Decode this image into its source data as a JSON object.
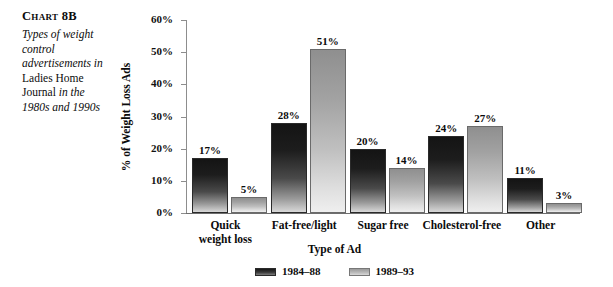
{
  "figure": {
    "label": "Chart 8B",
    "caption_lines": [
      {
        "text": "Types of weight",
        "style": "italic"
      },
      {
        "text": "control",
        "style": "italic"
      },
      {
        "text": "advertisements in",
        "style": "italic"
      },
      {
        "text": "Ladies Home",
        "style": "roman"
      },
      {
        "text": "Journal",
        "style": "roman",
        "trailing": " in the",
        "trailing_style": "italic"
      },
      {
        "text": "1980s and 1990s",
        "style": "italic"
      }
    ],
    "caption_plain": "Types of weight control advertisements in Ladies Home Journal in the 1980s and 1990s"
  },
  "chart_data": {
    "type": "bar",
    "title": "Chart 8B",
    "subtitle": "Types of weight control advertisements in Ladies Home Journal in the 1980s and 1990s",
    "xlabel": "Type of Ad",
    "ylabel": "% of Weight Loss Ads",
    "ylim": [
      0,
      60
    ],
    "yticks": [
      0,
      10,
      20,
      30,
      40,
      50,
      60
    ],
    "ytick_labels": [
      "0%",
      "10%",
      "20%",
      "30%",
      "40%",
      "50%",
      "60%"
    ],
    "grid": false,
    "legend_position": "bottom-center",
    "categories": [
      "Quick\nweight loss",
      "Fat-free/light",
      "Sugar free",
      "Cholesterol-free",
      "Other"
    ],
    "category_labels_plain": [
      "Quick weight loss",
      "Fat-free/light",
      "Sugar free",
      "Cholesterol-free",
      "Other"
    ],
    "series": [
      {
        "name": "1984–88",
        "color": "#1d1d1d",
        "values": [
          17,
          28,
          20,
          24,
          11
        ],
        "value_labels": [
          "17%",
          "28%",
          "20%",
          "24%",
          "11%"
        ]
      },
      {
        "name": "1989–93",
        "color": "#b8b8b8",
        "values": [
          5,
          51,
          14,
          27,
          3
        ],
        "value_labels": [
          "5%",
          "51%",
          "14%",
          "27%",
          "3%"
        ]
      }
    ]
  },
  "legend": {
    "items": [
      {
        "label": "1984–88",
        "swatch": "series-a"
      },
      {
        "label": "1989–93",
        "swatch": "series-b"
      }
    ]
  }
}
